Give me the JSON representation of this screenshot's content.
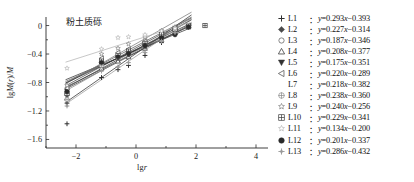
{
  "chart_data": {
    "type": "scatter",
    "title": "粉土质砾",
    "xlabel": "lgr",
    "ylabel": "lgM(r)/M",
    "xlim": [
      -3.0,
      4.4
    ],
    "ylim": [
      -1.72,
      0.12
    ],
    "xticks": [
      -2,
      0,
      2,
      4
    ],
    "xtick_labels": [
      "-2",
      "0",
      "2",
      "4"
    ],
    "xminor_ticks": [
      -3,
      -1,
      1,
      3
    ],
    "yticks": [
      0,
      -0.4,
      -0.8,
      -1.2,
      -1.6
    ],
    "ytick_labels": [
      "0",
      "-0.4",
      "-0.8",
      "-1.2",
      "-1.6"
    ],
    "yminor_ticks": [
      -0.2,
      -0.6,
      -1.0,
      -1.4
    ],
    "grid": false,
    "legend_position": "right-outside",
    "fit_x_range": [
      -2.35,
      1.85
    ],
    "series": [
      {
        "name": "L1",
        "equation": "y=0.293x-0.393",
        "slope": 0.293,
        "intercept": -0.393,
        "marker": "plus",
        "color": "#2f2f2f",
        "points": [
          {
            "x": -2.3,
            "y": -1.38
          },
          {
            "x": -2.3,
            "y": -1.09
          },
          {
            "x": -1.15,
            "y": -0.73
          },
          {
            "x": -0.6,
            "y": -0.62
          },
          {
            "x": -0.25,
            "y": -0.56
          },
          {
            "x": 0.3,
            "y": -0.42
          },
          {
            "x": 0.85,
            "y": -0.24
          },
          {
            "x": 1.3,
            "y": -0.12
          }
        ]
      },
      {
        "name": "L2",
        "equation": "y=0.227x-0.314",
        "slope": 0.227,
        "intercept": -0.314,
        "marker": "diamond-filled",
        "color": "#4a4a4a",
        "points": [
          {
            "x": -2.3,
            "y": -0.98
          },
          {
            "x": -1.15,
            "y": -0.52
          },
          {
            "x": -0.6,
            "y": -0.44
          },
          {
            "x": -0.25,
            "y": -0.38
          },
          {
            "x": 0.3,
            "y": -0.26
          },
          {
            "x": 0.85,
            "y": -0.15
          },
          {
            "x": 1.3,
            "y": -0.06
          },
          {
            "x": 1.75,
            "y": -0.01
          }
        ]
      },
      {
        "name": "L3",
        "equation": "y=0.187x-0.346",
        "slope": 0.187,
        "intercept": -0.346,
        "marker": "circle-open",
        "color": "#6a6a6a",
        "points": [
          {
            "x": -2.3,
            "y": -0.96
          },
          {
            "x": -1.15,
            "y": -0.55
          },
          {
            "x": -0.6,
            "y": -0.46
          },
          {
            "x": -0.25,
            "y": -0.4
          },
          {
            "x": 0.3,
            "y": -0.29
          },
          {
            "x": 0.85,
            "y": -0.18
          },
          {
            "x": 1.3,
            "y": -0.08
          },
          {
            "x": 1.75,
            "y": -0.02
          }
        ]
      },
      {
        "name": "L4",
        "equation": "y=0.208x-0.377",
        "slope": 0.208,
        "intercept": -0.377,
        "marker": "triangle-up-open",
        "color": "#3f3f3f",
        "points": [
          {
            "x": -2.3,
            "y": -1.02
          },
          {
            "x": -1.15,
            "y": -0.6
          },
          {
            "x": -0.6,
            "y": -0.5
          },
          {
            "x": -0.25,
            "y": -0.44
          },
          {
            "x": 0.3,
            "y": -0.32
          },
          {
            "x": 0.85,
            "y": -0.2
          },
          {
            "x": 1.3,
            "y": -0.1
          },
          {
            "x": 1.75,
            "y": -0.02
          }
        ]
      },
      {
        "name": "L5",
        "equation": "y=0.175x-0.351",
        "slope": 0.175,
        "intercept": -0.351,
        "marker": "triangle-down-filled",
        "color": "#333333",
        "points": [
          {
            "x": -2.3,
            "y": -0.92
          },
          {
            "x": -1.15,
            "y": -0.55
          },
          {
            "x": -0.6,
            "y": -0.46
          },
          {
            "x": -0.25,
            "y": -0.41
          },
          {
            "x": 0.3,
            "y": -0.3
          },
          {
            "x": 0.85,
            "y": -0.19
          },
          {
            "x": 1.3,
            "y": -0.09
          },
          {
            "x": 1.75,
            "y": -0.02
          }
        ]
      },
      {
        "name": "L6",
        "equation": "y=0.220x-0.289",
        "slope": 0.22,
        "intercept": -0.289,
        "marker": "triangle-left-open",
        "color": "#5a5a5a",
        "points": [
          {
            "x": -2.3,
            "y": -0.88
          },
          {
            "x": -1.15,
            "y": -0.46
          },
          {
            "x": -0.6,
            "y": -0.38
          },
          {
            "x": -0.25,
            "y": -0.33
          },
          {
            "x": 0.3,
            "y": -0.22
          },
          {
            "x": 0.85,
            "y": -0.1
          },
          {
            "x": 1.3,
            "y": -0.03
          },
          {
            "x": 1.75,
            "y": -0.01
          }
        ]
      },
      {
        "name": "L7",
        "equation": "y=0.218x-0.382",
        "slope": 0.218,
        "intercept": -0.382,
        "marker": "none",
        "color": "#454545",
        "points": []
      },
      {
        "name": "L8",
        "equation": "y=0.238x-0.360",
        "slope": 0.238,
        "intercept": -0.36,
        "marker": "circle-cross",
        "color": "#8a8a8a",
        "points": [
          {
            "x": -2.3,
            "y": -1.04
          },
          {
            "x": -1.15,
            "y": -0.56
          },
          {
            "x": -0.6,
            "y": -0.44
          },
          {
            "x": -0.25,
            "y": -0.38
          },
          {
            "x": 0.3,
            "y": -0.26
          },
          {
            "x": 0.85,
            "y": -0.14
          },
          {
            "x": 1.3,
            "y": -0.05
          }
        ]
      },
      {
        "name": "L9",
        "equation": "y=0.240x-0.256",
        "slope": 0.24,
        "intercept": -0.256,
        "marker": "star-open",
        "color": "#7b7b7b",
        "points": [
          {
            "x": -2.3,
            "y": -0.84
          },
          {
            "x": -1.15,
            "y": -0.4
          },
          {
            "x": -0.6,
            "y": -0.32
          },
          {
            "x": -0.25,
            "y": -0.26
          },
          {
            "x": 0.3,
            "y": -0.16
          },
          {
            "x": 0.85,
            "y": -0.07
          },
          {
            "x": 1.3,
            "y": -0.02
          }
        ]
      },
      {
        "name": "L10",
        "equation": "y=0.229x-0.341",
        "slope": 0.229,
        "intercept": -0.341,
        "marker": "square-cross",
        "color": "#3a3a3a",
        "points": [
          {
            "x": -2.3,
            "y": -0.95
          },
          {
            "x": -1.15,
            "y": -0.5
          },
          {
            "x": -0.6,
            "y": -0.42
          },
          {
            "x": -0.25,
            "y": -0.36
          },
          {
            "x": 0.3,
            "y": -0.25
          },
          {
            "x": 0.85,
            "y": -0.13
          },
          {
            "x": 1.3,
            "y": -0.05
          },
          {
            "x": 1.75,
            "y": -0.01
          },
          {
            "x": 2.3,
            "y": 0.0
          }
        ]
      },
      {
        "name": "L11",
        "equation": "y=0.134x-0.200",
        "slope": 0.134,
        "intercept": -0.2,
        "marker": "star-light",
        "color": "#b4b4b4",
        "points": [
          {
            "x": -2.3,
            "y": -0.6
          },
          {
            "x": -1.15,
            "y": -0.33
          },
          {
            "x": -0.6,
            "y": -0.17
          },
          {
            "x": -0.25,
            "y": -0.16
          },
          {
            "x": 0.3,
            "y": -0.13
          },
          {
            "x": 0.85,
            "y": -0.08
          },
          {
            "x": 1.3,
            "y": -0.04
          }
        ]
      },
      {
        "name": "L12",
        "equation": "y=0.201x-0.337",
        "slope": 0.201,
        "intercept": -0.337,
        "marker": "circle-filled",
        "color": "#2a2a2a",
        "points": [
          {
            "x": -2.3,
            "y": -0.93
          },
          {
            "x": -1.15,
            "y": -0.52
          },
          {
            "x": -0.6,
            "y": -0.44
          },
          {
            "x": -0.25,
            "y": -0.39
          },
          {
            "x": 0.3,
            "y": -0.28
          },
          {
            "x": 0.85,
            "y": -0.17
          },
          {
            "x": 1.3,
            "y": -0.13
          },
          {
            "x": 1.75,
            "y": -0.02
          }
        ]
      },
      {
        "name": "L13",
        "equation": "y=0.286x-0.432",
        "slope": 0.286,
        "intercept": -0.432,
        "marker": "plus-diamond",
        "color": "#9a9a9a",
        "points": [
          {
            "x": -2.3,
            "y": -1.13
          },
          {
            "x": -1.15,
            "y": -0.64
          },
          {
            "x": -0.6,
            "y": -0.58
          },
          {
            "x": -0.25,
            "y": -0.52
          },
          {
            "x": 0.3,
            "y": -0.38
          },
          {
            "x": 0.85,
            "y": -0.22
          },
          {
            "x": 1.3,
            "y": -0.1
          }
        ]
      }
    ]
  }
}
